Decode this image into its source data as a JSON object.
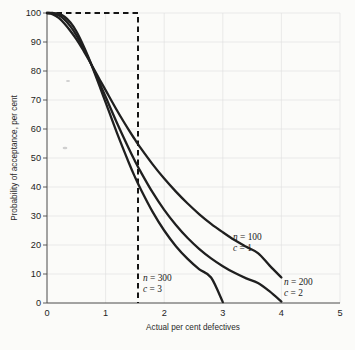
{
  "chart_data": {
    "type": "line",
    "title": "",
    "xlabel": "Actual per cent defectives",
    "ylabel": "Probability of acceptance, per cent",
    "xlim": [
      0,
      5
    ],
    "ylim": [
      0,
      100
    ],
    "xticks": [
      "0",
      "1",
      "2",
      "3",
      "4",
      "5"
    ],
    "xtick_values": [
      0,
      1,
      2,
      3,
      4,
      5
    ],
    "yticks": [
      "0",
      "10",
      "20",
      "30",
      "40",
      "50",
      "60",
      "70",
      "80",
      "90",
      "100"
    ],
    "ytick_values": [
      0,
      10,
      20,
      30,
      40,
      50,
      60,
      70,
      80,
      90,
      100
    ],
    "grid": true,
    "legend_position": "inline-annotations",
    "annotations": [
      {
        "name": "n = 100",
        "line1": "n = 100",
        "line2": "c = 1",
        "n": 100,
        "c": 1,
        "x": 4.05,
        "y": 21
      },
      {
        "name": "n = 300",
        "line1": "n = 300",
        "line2": "c = 3",
        "n": 300,
        "c": 3,
        "x": 1.62,
        "y": 10
      },
      {
        "name": "n = 200",
        "line1": "n = 200",
        "line2": "c = 2",
        "n": 200,
        "c": 2,
        "x": 4.05,
        "y": 7
      }
    ],
    "reference_lines": [
      {
        "name": "acceptable-quality-level",
        "type": "dashed",
        "x": 1.5,
        "y": 100,
        "style": "step-corner"
      }
    ],
    "series": [
      {
        "name": "n = 100, c = 1",
        "x": [
          0.0,
          0.1,
          0.2,
          0.3,
          0.4,
          0.5,
          0.6,
          0.7,
          0.8,
          0.9,
          1.0,
          1.2,
          1.4,
          1.5,
          1.6,
          1.8,
          2.0,
          2.2,
          2.4,
          2.6,
          2.8,
          3.0,
          3.2,
          3.4,
          3.6,
          3.8,
          4.0
        ],
        "y": [
          100.0,
          99.5,
          98.3,
          96.3,
          93.8,
          91.0,
          87.8,
          84.3,
          80.7,
          77.0,
          73.4,
          66.2,
          59.5,
          56.4,
          53.4,
          47.9,
          42.9,
          38.4,
          34.3,
          30.6,
          27.3,
          24.4,
          21.7,
          19.4,
          17.2,
          12.9,
          8.8
        ]
      },
      {
        "name": "n = 200, c = 2",
        "x": [
          0.0,
          0.1,
          0.2,
          0.3,
          0.4,
          0.5,
          0.6,
          0.7,
          0.8,
          0.9,
          1.0,
          1.2,
          1.4,
          1.5,
          1.6,
          1.8,
          2.0,
          2.2,
          2.4,
          2.6,
          2.8,
          3.0,
          3.2,
          3.4,
          3.6,
          3.8,
          4.0
        ],
        "y": [
          100.0,
          99.9,
          99.2,
          97.7,
          95.4,
          92.4,
          88.8,
          84.7,
          80.3,
          75.7,
          71.1,
          61.8,
          53.1,
          49.0,
          45.2,
          38.2,
          32.1,
          26.9,
          22.4,
          18.6,
          15.4,
          12.7,
          10.4,
          8.5,
          6.9,
          4.0,
          0.5
        ]
      },
      {
        "name": "n = 300, c = 3",
        "x": [
          0.0,
          0.1,
          0.2,
          0.3,
          0.4,
          0.5,
          0.6,
          0.7,
          0.8,
          0.9,
          1.0,
          1.2,
          1.4,
          1.5,
          1.6,
          1.8,
          2.0,
          2.2,
          2.4,
          2.6,
          2.8,
          3.0
        ],
        "y": [
          100.0,
          100.0,
          99.7,
          98.7,
          96.7,
          93.7,
          89.7,
          85.1,
          80.0,
          74.6,
          69.2,
          58.3,
          48.2,
          43.5,
          39.2,
          31.5,
          25.0,
          19.6,
          15.2,
          11.6,
          8.8,
          0.3
        ]
      }
    ],
    "colors": {
      "curve": "#1f1f1f",
      "grid": "#dedede",
      "axis": "#4a4a4a",
      "background": "#fbfbf9",
      "dashed_reference": "#151515"
    }
  }
}
